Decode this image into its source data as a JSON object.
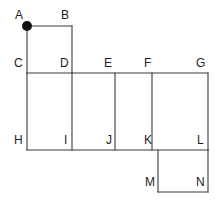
{
  "figure": {
    "canvas": {
      "width": 217,
      "height": 202,
      "background": "#ffffff"
    },
    "style": {
      "edge_color": "#3a3a3a",
      "edge_width": 1.1,
      "face_color": "#ffffff",
      "dot_color": "#111111",
      "label_color": "#1d1d1d",
      "label_font_size": 12
    },
    "marked_vertex": {
      "name": "A",
      "x": 27,
      "y": 26,
      "radius": 5,
      "color": "#111111"
    },
    "grid": {
      "x_columns": [
        27,
        72,
        115,
        152,
        208
      ],
      "y_rows": [
        26,
        73,
        150,
        192
      ]
    },
    "faces": [
      {
        "name": "ABDC",
        "x": 27,
        "y": 26,
        "width": 45,
        "height": 47
      },
      {
        "name": "CDIH",
        "x": 27,
        "y": 73,
        "width": 45,
        "height": 77
      },
      {
        "name": "DEJI",
        "x": 72,
        "y": 73,
        "width": 43,
        "height": 77
      },
      {
        "name": "EFKJ",
        "x": 115,
        "y": 73,
        "width": 37,
        "height": 77
      },
      {
        "name": "FGLK",
        "x": 152,
        "y": 73,
        "width": 56,
        "height": 77
      },
      {
        "name": "KLNM",
        "x": 158,
        "y": 150,
        "width": 50,
        "height": 42
      }
    ],
    "edges": [
      {
        "name": "A-B",
        "x1": 27,
        "y1": 26,
        "x2": 72,
        "y2": 26
      },
      {
        "name": "B-D",
        "x1": 72,
        "y1": 26,
        "x2": 72,
        "y2": 73
      },
      {
        "name": "A-C",
        "x1": 27,
        "y1": 26,
        "x2": 27,
        "y2": 73
      },
      {
        "name": "C-G",
        "x1": 27,
        "y1": 73,
        "x2": 208,
        "y2": 73
      },
      {
        "name": "C-H",
        "x1": 27,
        "y1": 73,
        "x2": 27,
        "y2": 150
      },
      {
        "name": "D-I",
        "x1": 72,
        "y1": 73,
        "x2": 72,
        "y2": 150
      },
      {
        "name": "E-J",
        "x1": 115,
        "y1": 73,
        "x2": 115,
        "y2": 150
      },
      {
        "name": "F-K",
        "x1": 152,
        "y1": 73,
        "x2": 152,
        "y2": 150
      },
      {
        "name": "G-L",
        "x1": 208,
        "y1": 73,
        "x2": 208,
        "y2": 150
      },
      {
        "name": "H-L",
        "x1": 27,
        "y1": 150,
        "x2": 208,
        "y2": 150
      },
      {
        "name": "K-M",
        "x1": 158,
        "y1": 150,
        "x2": 158,
        "y2": 192
      },
      {
        "name": "L-N",
        "x1": 208,
        "y1": 150,
        "x2": 208,
        "y2": 192
      },
      {
        "name": "M-N",
        "x1": 158,
        "y1": 192,
        "x2": 208,
        "y2": 192
      }
    ],
    "labels": [
      {
        "name": "vertex-label-A",
        "text": "A",
        "left": 15,
        "top": 9,
        "align": "left"
      },
      {
        "name": "vertex-label-B",
        "text": "B",
        "left": 61,
        "top": 9,
        "align": "left"
      },
      {
        "name": "vertex-label-C",
        "text": "C",
        "left": 14,
        "top": 57,
        "align": "left"
      },
      {
        "name": "vertex-label-D",
        "text": "D",
        "left": 60,
        "top": 57,
        "align": "left"
      },
      {
        "name": "vertex-label-E",
        "text": "E",
        "left": 104,
        "top": 57,
        "align": "left"
      },
      {
        "name": "vertex-label-F",
        "text": "F",
        "left": 144,
        "top": 57,
        "align": "left"
      },
      {
        "name": "vertex-label-G",
        "text": "G",
        "left": 196,
        "top": 57,
        "align": "left"
      },
      {
        "name": "vertex-label-H",
        "text": "H",
        "left": 14,
        "top": 134,
        "align": "left"
      },
      {
        "name": "vertex-label-I",
        "text": "I",
        "left": 64,
        "top": 134,
        "align": "left"
      },
      {
        "name": "vertex-label-J",
        "text": "J",
        "left": 106,
        "top": 134,
        "align": "left"
      },
      {
        "name": "vertex-label-K",
        "text": "K",
        "left": 144,
        "top": 134,
        "align": "left"
      },
      {
        "name": "vertex-label-L",
        "text": "L",
        "left": 197,
        "top": 134,
        "align": "left"
      },
      {
        "name": "vertex-label-M",
        "text": "M",
        "left": 145,
        "top": 176,
        "align": "left"
      },
      {
        "name": "vertex-label-N",
        "text": "N",
        "left": 196,
        "top": 176,
        "align": "left"
      }
    ]
  }
}
